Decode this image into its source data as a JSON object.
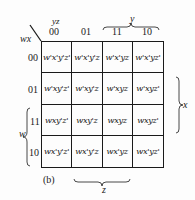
{
  "corner": {
    "row_var": "wx",
    "col_var": "yz"
  },
  "columns": [
    "00",
    "01",
    "11",
    "10"
  ],
  "rows": [
    {
      "label": "00",
      "cells": [
        "w'x'y'z'",
        "w'x'y'z",
        "w'x'yz",
        "w'x'yz'"
      ]
    },
    {
      "label": "01",
      "cells": [
        "w'xy'z'",
        "w'xy'z",
        "w'xyz",
        "w'xyz'"
      ]
    },
    {
      "label": "11",
      "cells": [
        "wxy'z'",
        "wxy'z",
        "wxyz",
        "wxyz'"
      ]
    },
    {
      "label": "10",
      "cells": [
        "wx'y'z'",
        "wx'y'z",
        "wx'yz",
        "wx'yz'"
      ]
    }
  ],
  "braces": {
    "top": "y",
    "right": "x",
    "left": "w",
    "bottom": "z"
  },
  "caption": "(b)"
}
